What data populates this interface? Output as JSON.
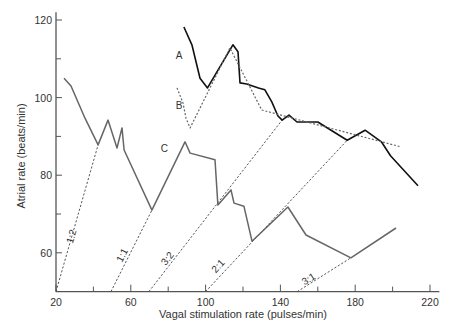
{
  "chart_data": {
    "type": "line",
    "title": "",
    "xlabel": "Vagal stimulation rate (pulses/min)",
    "ylabel": "Atrial rate (beats/min)",
    "xlim": [
      20,
      225
    ],
    "ylim": [
      50,
      122
    ],
    "xticks": [
      20,
      40,
      60,
      80,
      100,
      120,
      140,
      160,
      180,
      200,
      220
    ],
    "xtick_labels": [
      "20",
      "",
      "60",
      "",
      "100",
      "",
      "140",
      "",
      "180",
      "",
      "220"
    ],
    "yticks": [
      60,
      70,
      80,
      90,
      100,
      110,
      120
    ],
    "ytick_labels": [
      "60",
      "",
      "80",
      "",
      "100",
      "",
      "120"
    ],
    "grid": false,
    "series": [
      {
        "name": "A",
        "style": "solid-dark",
        "label_at": [
          84,
          110
        ],
        "points": [
          [
            88.4,
            118.2
          ],
          [
            92.7,
            113.6
          ],
          [
            97,
            105
          ],
          [
            101,
            102.5
          ],
          [
            114.6,
            113.6
          ],
          [
            117.3,
            111.8
          ],
          [
            118.4,
            103.8
          ],
          [
            122,
            103.5
          ],
          [
            128.3,
            102.5
          ],
          [
            131.7,
            102
          ],
          [
            135.4,
            98.9
          ],
          [
            138.6,
            95.3
          ],
          [
            140.9,
            94.2
          ],
          [
            144.6,
            95.5
          ],
          [
            148.9,
            93.7
          ],
          [
            160,
            93.7
          ],
          [
            175.7,
            89
          ],
          [
            185.3,
            91.6
          ],
          [
            194,
            88.6
          ],
          [
            198.9,
            85
          ],
          [
            213.6,
            77.3
          ]
        ]
      },
      {
        "name": "B",
        "style": "dotted",
        "label_at": [
          84,
          97
        ],
        "points": [
          [
            84.7,
            102.5
          ],
          [
            87.9,
            98.6
          ],
          [
            89.5,
            94.7
          ],
          [
            91.7,
            92.2
          ],
          [
            113,
            112.8
          ],
          [
            130,
            96.8
          ],
          [
            204.5,
            87.3
          ]
        ]
      },
      {
        "name": "C",
        "style": "solid-gray",
        "label_at": [
          76,
          86
        ],
        "points": [
          [
            24.3,
            105
          ],
          [
            28,
            103
          ],
          [
            35.5,
            94.7
          ],
          [
            42.5,
            87.8
          ],
          [
            47.8,
            94.2
          ],
          [
            52.6,
            87
          ],
          [
            55.3,
            92.2
          ],
          [
            56.4,
            86.5
          ],
          [
            71.3,
            71
          ],
          [
            89,
            88.6
          ],
          [
            91.7,
            85.7
          ],
          [
            105,
            84
          ],
          [
            106.6,
            72.3
          ],
          [
            113.6,
            76.2
          ],
          [
            115.2,
            72.8
          ],
          [
            120.5,
            72
          ],
          [
            124.8,
            63
          ],
          [
            144,
            71.8
          ],
          [
            153.7,
            64.6
          ],
          [
            177.7,
            58.7
          ],
          [
            201.8,
            66.4
          ]
        ]
      }
    ],
    "ratio_lines": [
      {
        "label": "1:2",
        "from": [
          20,
          50
        ],
        "to": [
          42.5,
          87.8
        ],
        "label_at": [
          30,
          64
        ]
      },
      {
        "label": "1:1",
        "from": [
          49.4,
          50
        ],
        "to": [
          71.3,
          71
        ],
        "label_at": [
          57,
          59
        ]
      },
      {
        "label": "3:2",
        "from": [
          69.7,
          50
        ],
        "to": [
          140.9,
          94.2
        ],
        "label_at": [
          81,
          58
        ]
      },
      {
        "label": "2:1",
        "from": [
          100,
          50
        ],
        "to": [
          175.7,
          89
        ],
        "label_at": [
          108,
          56
        ]
      },
      {
        "label": "3:1",
        "from": [
          149,
          50
        ],
        "to": [
          177.7,
          58.7
        ],
        "label_at": [
          156,
          52.5
        ]
      }
    ]
  }
}
